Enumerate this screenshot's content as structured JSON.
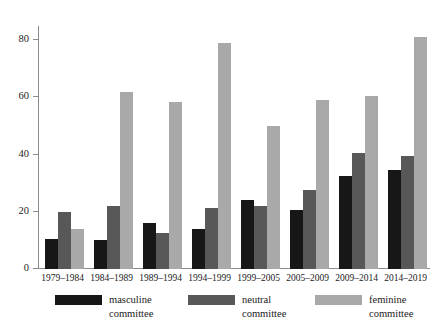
{
  "chart_data": {
    "type": "bar",
    "title": "",
    "subtitle": "",
    "xlabel": "",
    "ylabel": "",
    "ylim": [
      0,
      85
    ],
    "yticks": [
      0,
      20,
      40,
      60,
      80
    ],
    "grid": false,
    "legend_position": "bottom",
    "orientation": "vertical",
    "grouping": "grouped",
    "categories": [
      "1979–1984",
      "1984–1989",
      "1989–1994",
      "1994–1999",
      "1999–2005",
      "2005–2009",
      "2009–2014",
      "2014–2019"
    ],
    "series": [
      {
        "name": "masculine committee",
        "color": "#171717",
        "values": [
          10.5,
          10,
          16,
          14,
          24,
          20.5,
          32.5,
          34.5
        ]
      },
      {
        "name": "neutral committee",
        "color": "#585858",
        "values": [
          20,
          22,
          12.5,
          21.5,
          22,
          27.5,
          40.5,
          39.5
        ]
      },
      {
        "name": "feminine committee",
        "color": "#a9a9a9",
        "values": [
          14,
          62,
          58.5,
          79,
          50,
          59,
          60.5,
          81
        ]
      }
    ]
  },
  "axis": {
    "y_tick_labels": [
      "0",
      "20",
      "40",
      "60",
      "80"
    ]
  },
  "legend": {
    "items": [
      {
        "label_line1": "masculine",
        "label_line2": "committee",
        "color": "#171717",
        "swatch_name": "legend-swatch-masculine"
      },
      {
        "label_line1": "neutral",
        "label_line2": "committee",
        "color": "#585858",
        "swatch_name": "legend-swatch-neutral"
      },
      {
        "label_line1": "feminine",
        "label_line2": "committee",
        "color": "#a9a9a9",
        "swatch_name": "legend-swatch-feminine"
      }
    ]
  },
  "colors": {
    "background": "#ffffff",
    "axis": "#8c8c8c",
    "text": "#1a1a1a"
  }
}
